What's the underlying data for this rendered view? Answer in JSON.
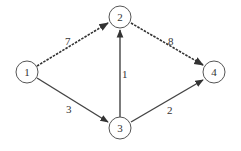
{
  "graph": {
    "type": "directed-weighted-graph",
    "nodes": [
      {
        "id": "1",
        "label": "1",
        "x": 27,
        "y": 72
      },
      {
        "id": "2",
        "label": "2",
        "x": 120,
        "y": 17
      },
      {
        "id": "3",
        "label": "3",
        "x": 120,
        "y": 128
      },
      {
        "id": "4",
        "label": "4",
        "x": 214,
        "y": 72
      }
    ],
    "edges": [
      {
        "from": "1",
        "to": "2",
        "weight": "7",
        "style": "dashed"
      },
      {
        "from": "2",
        "to": "4",
        "weight": "8",
        "style": "dashed"
      },
      {
        "from": "1",
        "to": "3",
        "weight": "3",
        "style": "solid"
      },
      {
        "from": "3",
        "to": "2",
        "weight": "1",
        "style": "solid"
      },
      {
        "from": "3",
        "to": "4",
        "weight": "2",
        "style": "solid"
      }
    ]
  },
  "colors": {
    "edge": "#333333",
    "node_stroke": "#555555",
    "background": "#ffffff"
  }
}
